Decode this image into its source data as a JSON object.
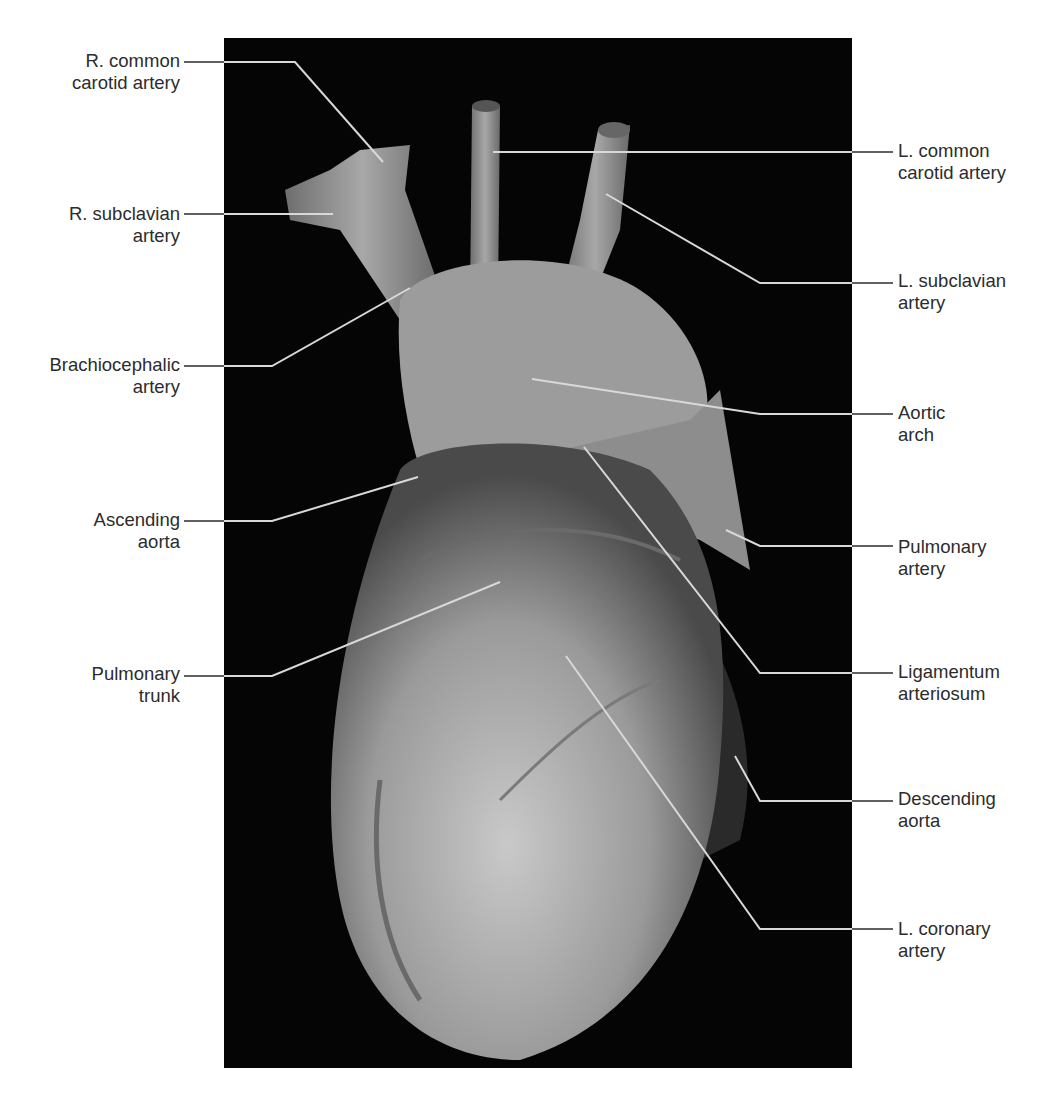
{
  "figure": {
    "panel_background": "#050505",
    "leader_line_color_on_photo": "#d8d8d8",
    "leader_line_color_on_white": "#3a3a3a",
    "text_color": "#2c2c2c"
  },
  "labels_left": [
    {
      "id": "r-common-carotid-artery",
      "lines": [
        "R. common",
        "carotid artery"
      ],
      "x": 180,
      "y": 50,
      "leader": [
        [
          184,
          62
        ],
        [
          295,
          62
        ],
        [
          383,
          162
        ]
      ]
    },
    {
      "id": "r-subclavian-artery",
      "lines": [
        "R. subclavian",
        "artery"
      ],
      "x": 180,
      "y": 203,
      "leader": [
        [
          184,
          214
        ],
        [
          333,
          214
        ]
      ]
    },
    {
      "id": "brachiocephalic-artery",
      "lines": [
        "Brachiocephalic",
        "artery"
      ],
      "x": 180,
      "y": 354,
      "leader": [
        [
          184,
          366
        ],
        [
          272,
          366
        ],
        [
          410,
          288
        ]
      ]
    },
    {
      "id": "ascending-aorta",
      "lines": [
        "Ascending",
        "aorta"
      ],
      "x": 180,
      "y": 509,
      "leader": [
        [
          184,
          521
        ],
        [
          272,
          521
        ],
        [
          418,
          477
        ]
      ]
    },
    {
      "id": "pulmonary-trunk",
      "lines": [
        "Pulmonary",
        "trunk"
      ],
      "x": 180,
      "y": 663,
      "leader": [
        [
          184,
          676
        ],
        [
          272,
          676
        ],
        [
          500,
          582
        ]
      ]
    }
  ],
  "labels_right": [
    {
      "id": "l-common-carotid-artery",
      "lines": [
        "L. common",
        "carotid artery"
      ],
      "x": 898,
      "y": 140,
      "leader": [
        [
          893,
          152
        ],
        [
          493,
          152
        ]
      ]
    },
    {
      "id": "l-subclavian-artery",
      "lines": [
        "L. subclavian",
        "artery"
      ],
      "x": 898,
      "y": 270,
      "leader": [
        [
          893,
          283
        ],
        [
          760,
          283
        ],
        [
          606,
          194
        ]
      ]
    },
    {
      "id": "aortic-arch",
      "lines": [
        "Aortic",
        "arch"
      ],
      "x": 898,
      "y": 402,
      "leader": [
        [
          893,
          414
        ],
        [
          760,
          414
        ],
        [
          532,
          379
        ]
      ]
    },
    {
      "id": "pulmonary-artery",
      "lines": [
        "Pulmonary",
        "artery"
      ],
      "x": 898,
      "y": 536,
      "leader": [
        [
          893,
          546
        ],
        [
          760,
          546
        ],
        [
          726,
          530
        ]
      ]
    },
    {
      "id": "ligamentum-arteriosum",
      "lines": [
        "Ligamentum",
        "arteriosum"
      ],
      "x": 898,
      "y": 661,
      "leader": [
        [
          893,
          673
        ],
        [
          760,
          673
        ],
        [
          584,
          447
        ]
      ]
    },
    {
      "id": "descending-aorta",
      "lines": [
        "Descending",
        "aorta"
      ],
      "x": 898,
      "y": 788,
      "leader": [
        [
          893,
          801
        ],
        [
          760,
          801
        ],
        [
          735,
          756
        ]
      ]
    },
    {
      "id": "l-coronary-artery",
      "lines": [
        "L. coronary",
        "artery"
      ],
      "x": 898,
      "y": 918,
      "leader": [
        [
          893,
          929
        ],
        [
          760,
          929
        ],
        [
          566,
          656
        ]
      ]
    }
  ]
}
